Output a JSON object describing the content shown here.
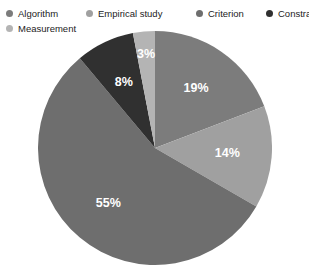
{
  "chart_data": {
    "type": "pie",
    "title": "",
    "categories": [
      "Algorithm",
      "Empirical study",
      "Criterion",
      "Constraint",
      "Measurement"
    ],
    "values": [
      19,
      14,
      55,
      8,
      3
    ],
    "value_labels": [
      "19%",
      "14%",
      "55%",
      "8%",
      "3%"
    ],
    "colors": [
      "#7c7c7c",
      "#a0a0a0",
      "#6e6e6e",
      "#303030",
      "#b4b4b4"
    ],
    "legend_position": "top",
    "grid": false,
    "start_angle_deg": 0,
    "direction": "clockwise",
    "label_color": "#ffffff",
    "background": "#ffffff"
  },
  "legend": {
    "items": [
      {
        "label": "Algorithm",
        "color": "#7c7c7c"
      },
      {
        "label": "Empirical study",
        "color": "#a0a0a0"
      },
      {
        "label": "Criterion",
        "color": "#6e6e6e"
      },
      {
        "label": "Constraint",
        "color": "#303030"
      },
      {
        "label": "Measurement",
        "color": "#b4b4b4"
      }
    ]
  },
  "slices": [
    {
      "name": "Algorithm",
      "percent": "19%",
      "color": "#7c7c7c"
    },
    {
      "name": "Empirical study",
      "percent": "14%",
      "color": "#a0a0a0"
    },
    {
      "name": "Criterion",
      "percent": "55%",
      "color": "#6e6e6e"
    },
    {
      "name": "Constraint",
      "percent": "8%",
      "color": "#303030"
    },
    {
      "name": "Measurement",
      "percent": "3%",
      "color": "#b4b4b4"
    }
  ]
}
